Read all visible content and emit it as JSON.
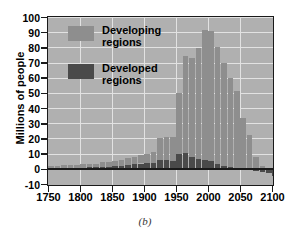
{
  "panel_label": "(b)",
  "colors": {
    "developing": "#8e8e8e",
    "developed": "#4a4a4a",
    "plot_background": "#b0b0b0",
    "grid": "#e2e2e2",
    "axis": "#1a1a1a"
  },
  "legend": {
    "position": "top-left-inside",
    "items": [
      {
        "label": "Developing regions",
        "line1": "Developing",
        "line2": "regions",
        "color": "#8e8e8e",
        "swatch": "legend-swatch-developing"
      },
      {
        "label": "Developed regions",
        "line1": "Developed",
        "line2": "regions",
        "color": "#4a4a4a",
        "swatch": "legend-swatch-developed"
      }
    ]
  },
  "chart_data": {
    "type": "bar",
    "title": "",
    "subtitle": "",
    "xlabel": "",
    "ylabel": "Millions of people",
    "stacked": true,
    "grid": true,
    "xlim": [
      1750,
      2100
    ],
    "ylim": [
      -10,
      100
    ],
    "ytick_labels": [
      "100",
      "90",
      "80",
      "70",
      "60",
      "50",
      "40",
      "30",
      "20",
      "10",
      "0",
      "-10"
    ],
    "yticks": [
      100,
      90,
      80,
      70,
      60,
      50,
      40,
      30,
      20,
      10,
      0,
      -10
    ],
    "xtick_labels": [
      "1750",
      "1800",
      "1850",
      "1900",
      "1950",
      "2000",
      "2050",
      "2100"
    ],
    "xticks": [
      1750,
      1800,
      1850,
      1900,
      1950,
      2000,
      2050,
      2100
    ],
    "categories": [
      1750,
      1760,
      1770,
      1780,
      1790,
      1800,
      1810,
      1820,
      1830,
      1840,
      1850,
      1860,
      1870,
      1880,
      1890,
      1900,
      1910,
      1920,
      1930,
      1940,
      1950,
      1960,
      1970,
      1980,
      1990,
      2000,
      2010,
      2020,
      2030,
      2040,
      2050,
      2060,
      2070,
      2080,
      2090,
      2100
    ],
    "series": [
      {
        "name": "Developing regions",
        "color": "#8e8e8e",
        "values": [
          1.5,
          1.5,
          1.8,
          1.8,
          2.0,
          2.2,
          2.3,
          2.5,
          3.0,
          3.2,
          3.5,
          4.0,
          4.5,
          5.0,
          5.5,
          6.0,
          7.0,
          14.5,
          15.5,
          16.0,
          40.0,
          63.5,
          65.0,
          73.0,
          86.0,
          86.0,
          77.0,
          68.0,
          59.0,
          51.0,
          33.5,
          22.0,
          8.0,
          2.0,
          0.0,
          0.0
        ]
      },
      {
        "name": "Developed regions",
        "color": "#4a4a4a",
        "values": [
          0.5,
          0.5,
          0.5,
          0.7,
          0.8,
          0.8,
          1.0,
          1.0,
          1.2,
          1.5,
          1.8,
          2.0,
          2.5,
          3.0,
          3.5,
          4.0,
          4.0,
          6.0,
          5.5,
          5.0,
          10.0,
          10.5,
          8.0,
          6.5,
          5.5,
          5.0,
          3.0,
          2.0,
          1.0,
          0.0,
          -0.5,
          -1.0,
          -1.5,
          -2.0,
          -3.0,
          -4.5
        ]
      }
    ],
    "totals": [
      2.0,
      2.0,
      2.3,
      2.5,
      2.8,
      3.0,
      3.3,
      3.5,
      4.2,
      4.7,
      5.3,
      6.0,
      7.0,
      8.0,
      9.0,
      10.0,
      11.0,
      20.5,
      21.0,
      21.0,
      50.0,
      74.0,
      73.0,
      79.5,
      91.5,
      91.0,
      80.0,
      70.0,
      60.0,
      51.0,
      33.0,
      21.0,
      6.5,
      0.0,
      -3.0,
      -4.5
    ],
    "peak": {
      "year": 1995,
      "value": 96
    },
    "annotations": []
  }
}
